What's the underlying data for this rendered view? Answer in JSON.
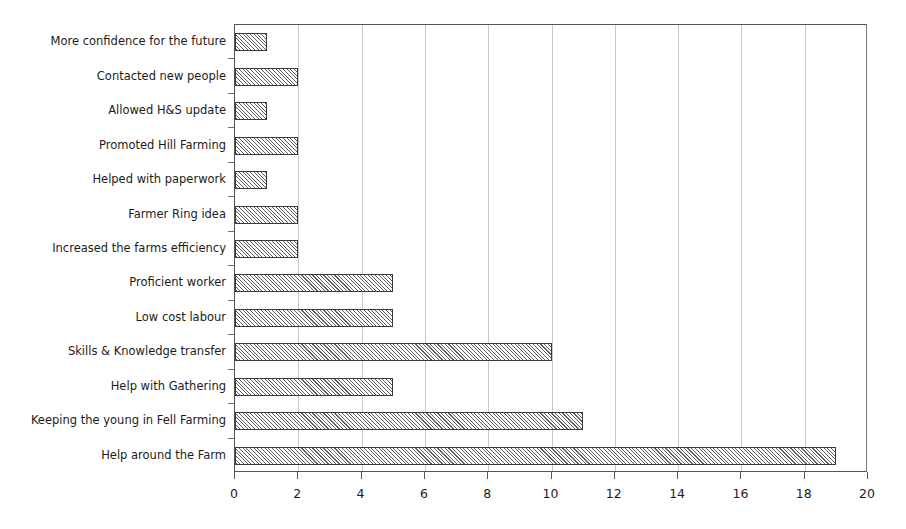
{
  "chart_data": {
    "type": "bar",
    "orientation": "horizontal",
    "title": "",
    "xlabel": "",
    "ylabel": "",
    "xlim": [
      0,
      20
    ],
    "xticks": [
      0,
      2,
      4,
      6,
      8,
      10,
      12,
      14,
      16,
      18,
      20
    ],
    "grid": "vertical",
    "legend": "none",
    "bar_style": {
      "fill": "diagonal-hatch",
      "edge_color": "#3a3a3a",
      "face_color": "#ffffff",
      "hatch_color": "#5d5d5d"
    },
    "categories": [
      "More confidence for the future",
      "Contacted new people",
      "Allowed H&S update",
      "Promoted Hill Farming",
      "Helped with paperwork",
      "Farmer Ring idea",
      "Increased the farms efficiency",
      "Proficient worker",
      "Low cost labour",
      "Skills & Knowledge transfer",
      "Help with Gathering",
      "Keeping the young in Fell Farming",
      "Help around the Farm"
    ],
    "values": [
      1,
      2,
      1,
      2,
      1,
      2,
      2,
      5,
      5,
      10,
      5,
      11,
      19
    ]
  },
  "axes": {
    "x_tick_labels": [
      "0",
      "2",
      "4",
      "6",
      "8",
      "10",
      "12",
      "14",
      "16",
      "18",
      "20"
    ],
    "gridline_color": "#c9c9c9",
    "axis_color": "#555555"
  }
}
